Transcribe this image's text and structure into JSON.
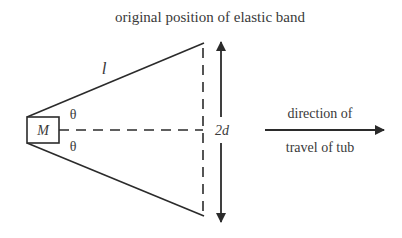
{
  "diagram": {
    "title": "original position of elastic band",
    "mass_label": "M",
    "length_label": "l",
    "angle_top": "θ",
    "angle_bottom": "θ",
    "width_label": "2d",
    "direction_line1": "direction of",
    "direction_line2": "travel of tub",
    "colors": {
      "line": "#2b2b2b",
      "text": "#3a3a3a",
      "background": "#ffffff"
    }
  }
}
